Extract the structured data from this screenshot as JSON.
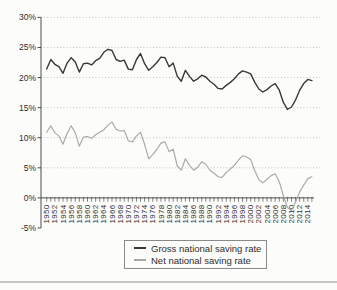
{
  "chart_data": {
    "type": "line",
    "title": "",
    "xlabel": "",
    "ylabel": "",
    "grid": "dotted horizontal lines at 5%-intervals",
    "legend_position": "bottom-center boxed",
    "axis_color": "#4d4d4d",
    "grid_color": "#b2b2b2",
    "label_color": "#2e2e2e",
    "background_color": "#fcfcfa",
    "ylim": [
      -5,
      30
    ],
    "yticks": [
      30,
      25,
      20,
      15,
      10,
      5,
      0,
      -5
    ],
    "ytick_labels": [
      "30%",
      "25%",
      "20%",
      "15%",
      "10%",
      "5%",
      "0%",
      "-5%"
    ],
    "xtick_label_years": [
      1950,
      1952,
      1954,
      1956,
      1958,
      1960,
      1962,
      1964,
      1966,
      1968,
      1970,
      1972,
      1974,
      1976,
      1978,
      1980,
      1982,
      1984,
      1986,
      1988,
      1990,
      1992,
      1994,
      1996,
      1998,
      2000,
      2002,
      2004,
      2006,
      2008,
      2010,
      2012,
      2014
    ],
    "x": [
      1950,
      1951,
      1952,
      1953,
      1954,
      1955,
      1956,
      1957,
      1958,
      1959,
      1960,
      1961,
      1962,
      1963,
      1964,
      1965,
      1966,
      1967,
      1968,
      1969,
      1970,
      1971,
      1972,
      1973,
      1974,
      1975,
      1976,
      1977,
      1978,
      1979,
      1980,
      1981,
      1982,
      1983,
      1984,
      1985,
      1986,
      1987,
      1988,
      1989,
      1990,
      1991,
      1992,
      1993,
      1994,
      1995,
      1996,
      1997,
      1998,
      1999,
      2000,
      2001,
      2002,
      2003,
      2004,
      2005,
      2006,
      2007,
      2008,
      2009,
      2010,
      2011,
      2012,
      2013,
      2014,
      2015
    ],
    "series": [
      {
        "name": "Gross national saving rate",
        "color": "#383838",
        "values": [
          21.4,
          23.0,
          22.2,
          21.8,
          20.7,
          22.4,
          23.3,
          22.6,
          20.9,
          22.3,
          22.4,
          22.1,
          22.8,
          23.2,
          24.2,
          24.7,
          24.5,
          23.0,
          22.7,
          22.9,
          21.4,
          21.3,
          23.0,
          24.0,
          22.3,
          21.2,
          21.8,
          22.5,
          23.4,
          23.3,
          21.8,
          22.4,
          20.2,
          19.4,
          21.2,
          20.2,
          19.4,
          19.8,
          20.4,
          20.1,
          19.4,
          18.9,
          18.2,
          18.1,
          18.7,
          19.2,
          19.8,
          20.6,
          21.1,
          20.9,
          20.6,
          19.2,
          18.1,
          17.6,
          18.0,
          18.6,
          19.0,
          17.9,
          15.9,
          14.7,
          15.1,
          16.3,
          17.9,
          19.0,
          19.7,
          19.5
        ]
      },
      {
        "name": "Net national saving rate",
        "color": "#a8a8a8",
        "values": [
          10.9,
          12.0,
          10.8,
          10.3,
          8.9,
          10.7,
          12.0,
          10.8,
          8.6,
          10.1,
          10.2,
          9.9,
          10.5,
          10.9,
          11.3,
          12.1,
          12.6,
          11.4,
          11.1,
          11.2,
          9.5,
          9.3,
          10.3,
          10.9,
          8.9,
          6.5,
          7.2,
          8.1,
          9.1,
          9.3,
          7.7,
          8.1,
          5.3,
          4.6,
          6.5,
          5.4,
          4.6,
          5.1,
          6.0,
          5.6,
          4.6,
          4.1,
          3.5,
          3.4,
          4.2,
          4.8,
          5.4,
          6.3,
          7.0,
          6.8,
          6.4,
          4.5,
          3.0,
          2.5,
          3.1,
          3.7,
          4.0,
          2.7,
          0.4,
          -1.6,
          -2.1,
          -0.7,
          1.0,
          2.1,
          3.2,
          3.5
        ]
      }
    ]
  }
}
